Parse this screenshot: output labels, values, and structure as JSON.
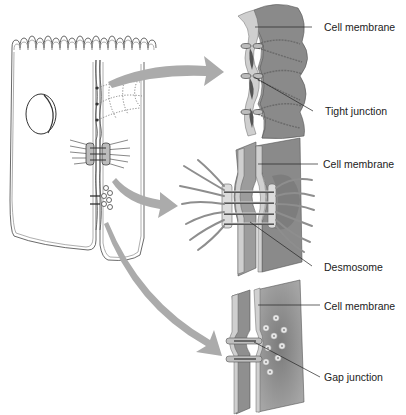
{
  "figure": {
    "type": "cell-junctions-diagram",
    "panels": [
      {
        "id": "tight",
        "labels": {
          "membrane": "Cell membrane",
          "junction": "Tight junction"
        }
      },
      {
        "id": "desmosome",
        "labels": {
          "membrane": "Cell membrane",
          "junction": "Desmosome"
        }
      },
      {
        "id": "gap",
        "labels": {
          "membrane": "Cell membrane",
          "junction": "Gap junction"
        }
      }
    ],
    "colors": {
      "background": "#ffffff",
      "arrow": "#a9a9a9",
      "membrane_dark": "#6e6e6e",
      "membrane_mid": "#8c8c8c",
      "membrane_light": "#c8c8c8",
      "line": "#222222"
    }
  }
}
